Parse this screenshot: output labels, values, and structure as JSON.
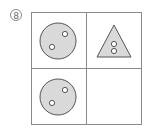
{
  "problem": {
    "number_label": "8"
  },
  "grid": {
    "rows": 2,
    "cols": 2,
    "line_color": "#8a8a8a",
    "cells": [
      {
        "row": 0,
        "col": 0,
        "shape": "circle",
        "dots": 2,
        "fill": "#d9d9d9"
      },
      {
        "row": 0,
        "col": 1,
        "shape": "triangle",
        "dots": 2,
        "fill": "#d9d9d9"
      },
      {
        "row": 1,
        "col": 0,
        "shape": "circle",
        "dots": 2,
        "fill": "#d9d9d9"
      },
      {
        "row": 1,
        "col": 1,
        "shape": "empty",
        "dots": 0
      }
    ]
  }
}
